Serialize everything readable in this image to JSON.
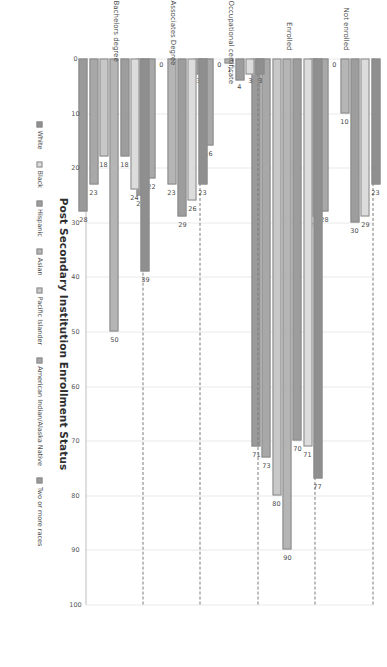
{
  "chart_data": {
    "type": "bar",
    "orientation": "horizontal-rotated",
    "title": "Post Secondary Institution Enrollment Status",
    "xlabel": "",
    "ylabel": "",
    "ylim": [
      0,
      100
    ],
    "yticks": [
      "0",
      "10",
      "20",
      "30",
      "40",
      "50",
      "60",
      "70",
      "80",
      "90",
      "100"
    ],
    "grid": true,
    "legend_position": "bottom",
    "categories": [
      "Not enrolled",
      "Enrolled",
      "Occupational certificate",
      "Associates Degree",
      "Bachelors degree"
    ],
    "series": [
      {
        "name": "White",
        "color": "#8f8f8f",
        "values": [
          23,
          77,
          3,
          23,
          39
        ]
      },
      {
        "name": "Black",
        "color": "#dcdcdc",
        "values": [
          29,
          71,
          3,
          26,
          24
        ]
      },
      {
        "name": "Hispanic",
        "color": "#9d9d9d",
        "values": [
          30,
          70,
          4,
          29,
          18
        ]
      },
      {
        "name": "Asian",
        "color": "#b5b5b5",
        "values": [
          10,
          90,
          1,
          23,
          50
        ]
      },
      {
        "name": "Pacific Islander",
        "color": "#c8c8c8",
        "values": [
          0,
          80,
          0,
          0,
          18
        ]
      },
      {
        "name": "American Indian/Alaska Native",
        "color": "#a8a8a8",
        "values": [
          28,
          73,
          16,
          22,
          23
        ]
      },
      {
        "name": "Two or more races",
        "color": "#9a9a9a",
        "values": [
          29,
          71,
          3,
          25,
          28
        ]
      }
    ]
  },
  "axis": {
    "tick_labels": [
      "0",
      "10",
      "20",
      "30",
      "40",
      "50",
      "60",
      "70",
      "80",
      "90",
      "100"
    ]
  }
}
